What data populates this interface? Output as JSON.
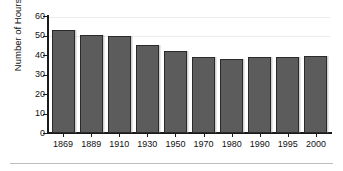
{
  "chart_data": {
    "type": "bar",
    "title": "",
    "xlabel": "",
    "ylabel": "Number of Hours",
    "categories": [
      "1869",
      "1889",
      "1910",
      "1930",
      "1950",
      "1970",
      "1980",
      "1990",
      "1995",
      "2000"
    ],
    "values": [
      53,
      50.5,
      49.5,
      45,
      42,
      39,
      38,
      39,
      39,
      39.5
    ],
    "ylim": [
      0,
      60
    ],
    "yticks": [
      0,
      10,
      20,
      30,
      40,
      50,
      60
    ],
    "ytick_labels": [
      "0",
      "10",
      "20",
      "30",
      "40",
      "50",
      "60"
    ],
    "grid": true,
    "legend": null,
    "bar_color": "#5c5c5c",
    "bar_edge_color": "#2a2a2a",
    "axis_color": "#1a1a1a",
    "background": "#ffffff"
  },
  "figure": {
    "name": "number-of-hours-by-year-bar-chart"
  }
}
